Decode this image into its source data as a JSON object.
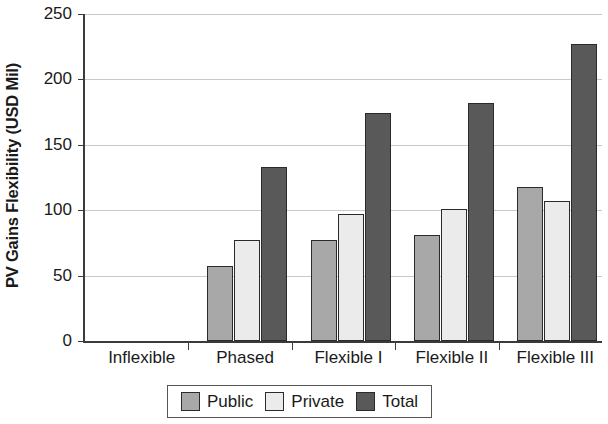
{
  "chart_data": {
    "type": "bar",
    "title": "",
    "xlabel": "",
    "ylabel": "PV Gains Flexibility (USD Mil)",
    "categories": [
      "Inflexible",
      "Phased",
      "Flexible I",
      "Flexible II",
      "Flexible III"
    ],
    "series": [
      {
        "name": "Public",
        "color": "#a8a8a8",
        "values": [
          0,
          57,
          77,
          81,
          118
        ]
      },
      {
        "name": "Private",
        "color": "#ebebeb",
        "values": [
          0,
          77,
          97,
          101,
          107
        ]
      },
      {
        "name": "Total",
        "color": "#595959",
        "values": [
          0,
          133,
          174,
          182,
          227
        ]
      }
    ],
    "ylim": [
      0,
      250
    ],
    "yticks": [
      0,
      50,
      100,
      150,
      200,
      250
    ],
    "ytick_labels": [
      "0",
      "50",
      "100",
      "150",
      "200",
      "250"
    ],
    "grid": true,
    "legend_position": "bottom"
  }
}
